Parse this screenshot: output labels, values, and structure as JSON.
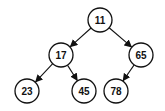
{
  "diagram": {
    "type": "binary-tree",
    "colors": {
      "stroke": "#111111",
      "fill": "#ffffff",
      "text": "#111111"
    },
    "radius": 12,
    "nodes": [
      {
        "id": "n11",
        "label": "11",
        "x": 100,
        "y": 20
      },
      {
        "id": "n17",
        "label": "17",
        "x": 61,
        "y": 55
      },
      {
        "id": "n65",
        "label": "65",
        "x": 141,
        "y": 55
      },
      {
        "id": "n23",
        "label": "23",
        "x": 27,
        "y": 91
      },
      {
        "id": "n45",
        "label": "45",
        "x": 84,
        "y": 91
      },
      {
        "id": "n78",
        "label": "78",
        "x": 116,
        "y": 91
      }
    ],
    "edges": [
      {
        "from": "n11",
        "to": "n17"
      },
      {
        "from": "n11",
        "to": "n65"
      },
      {
        "from": "n17",
        "to": "n23"
      },
      {
        "from": "n17",
        "to": "n45"
      },
      {
        "from": "n65",
        "to": "n78"
      }
    ]
  }
}
